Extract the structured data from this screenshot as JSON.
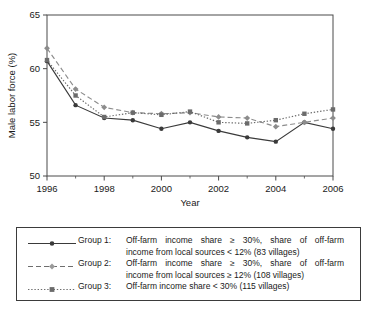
{
  "chart_data": {
    "type": "line",
    "title": "",
    "xlabel": "Year",
    "ylabel": "Male labor force (%)",
    "x": [
      1996,
      1997,
      1998,
      1999,
      2000,
      2001,
      2002,
      2003,
      2004,
      2005,
      2006
    ],
    "xlim": [
      1996,
      2006
    ],
    "ylim": [
      50,
      65
    ],
    "y_ticks": [
      50,
      55,
      60,
      65
    ],
    "x_ticks": [
      1996,
      1998,
      2000,
      2002,
      2004,
      2006
    ],
    "x_minor_ticks": [
      1997,
      1999,
      2001,
      2003,
      2005
    ],
    "grid": false,
    "legend_position": "below-plot",
    "series": [
      {
        "name": "Group 1",
        "marker": "circle",
        "line_style": "solid",
        "color": "#3a3a3a",
        "values": [
          60.7,
          56.6,
          55.4,
          55.2,
          54.4,
          55.0,
          54.2,
          53.6,
          53.2,
          55.0,
          54.4
        ]
      },
      {
        "name": "Group 2",
        "marker": "diamond",
        "line_style": "dashed",
        "color": "#8c8c8c",
        "values": [
          61.9,
          58.1,
          56.4,
          55.9,
          55.8,
          55.9,
          55.5,
          55.4,
          54.6,
          55.0,
          55.4
        ]
      },
      {
        "name": "Group 3",
        "marker": "square",
        "line_style": "dotted",
        "color": "#6b6b6b",
        "values": [
          60.8,
          57.5,
          55.5,
          55.9,
          55.7,
          56.0,
          55.0,
          54.9,
          55.2,
          55.8,
          56.2
        ]
      }
    ]
  },
  "axes": {
    "y_label": "Male labor force (%)",
    "x_label": "Year",
    "y_tick_labels": [
      "50",
      "55",
      "60",
      "65"
    ],
    "x_tick_labels": [
      "1996",
      "1998",
      "2000",
      "2002",
      "2004",
      "2006"
    ]
  },
  "legend": {
    "entries": [
      {
        "key": "Group 1:",
        "line1": "Off-farm income share ≥ 30%, share of off-farm",
        "line2": "income from local sources < 12% (83 villages)",
        "marker": "circle",
        "line_style": "solid"
      },
      {
        "key": "Group 2:",
        "line1": "Off-farm income share ≥ 30%, share of off-farm",
        "line2": "income from local sources ≥ 12% (108 villages)",
        "marker": "diamond",
        "line_style": "dashed"
      },
      {
        "key": "Group 3:",
        "line1": "Off-farm income share < 30% (115 villages)",
        "line2": "",
        "marker": "square",
        "line_style": "dotted"
      }
    ]
  },
  "caption": {
    "text": ""
  }
}
